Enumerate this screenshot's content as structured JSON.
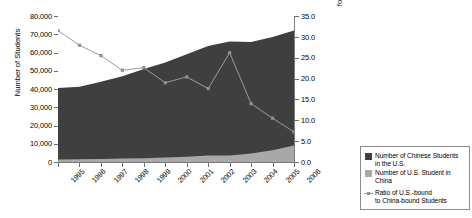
{
  "chart_data": {
    "type": "area",
    "title": "",
    "xlabel": "",
    "ylabel": "Number of Students",
    "ylabel_right": "Number of Chinese Students in America for Each American Student in China",
    "categories": [
      "1995",
      "1996",
      "1997",
      "1998",
      "1999",
      "2000",
      "2001",
      "2002",
      "2003",
      "2004",
      "2005",
      "2006"
    ],
    "ylim": [
      0,
      80000
    ],
    "yticks": [
      "0",
      "10,000",
      "20,000",
      "30,000",
      "40,000",
      "50,000",
      "60,000",
      "70,000",
      "80,000"
    ],
    "ytick_values": [
      0,
      10000,
      20000,
      30000,
      40000,
      50000,
      60000,
      70000,
      80000
    ],
    "ylim_right": [
      0,
      35
    ],
    "yticks_right": [
      "0.0",
      "5.0",
      "10.0",
      "15.0",
      "20.0",
      "25.0",
      "30.0",
      "35.0"
    ],
    "ytick_values_right": [
      0,
      5,
      10,
      15,
      20,
      25,
      30,
      35
    ],
    "grid": true,
    "legend_position": "outside-right-bottom",
    "series": [
      {
        "name": "Number of Chinese Students in the U.S.",
        "type": "area",
        "axis": "left",
        "color": "#3f3f3f",
        "values": [
          40500,
          41200,
          44000,
          47000,
          51000,
          54500,
          59000,
          63500,
          66000,
          65800,
          68500,
          72000
        ]
      },
      {
        "name": "Number of U.S. Student in China",
        "type": "area",
        "axis": "left",
        "color": "#a8a8a8",
        "values": [
          1400,
          1500,
          1700,
          1900,
          2100,
          2500,
          2900,
          3600,
          3500,
          4700,
          6400,
          9000
        ]
      },
      {
        "name": "Ratio of U.S.-bound to China-bound Students",
        "type": "line",
        "axis": "right",
        "color": "#9a9a9a",
        "marker": "square",
        "values": [
          31.5,
          28.0,
          25.5,
          22.0,
          22.6,
          19.0,
          20.4,
          17.6,
          26.2,
          14.0,
          10.5,
          7.2
        ]
      }
    ]
  },
  "legend": {
    "items": [
      {
        "label_line1": "Number of Chinese Students",
        "label_line2": "in the U.S.",
        "swatch": "dark-square-swatch"
      },
      {
        "label_line1": "Number of U.S. Student in China",
        "label_line2": "",
        "swatch": "light-square-swatch"
      },
      {
        "label_line1": "Ratio of U.S.-bound",
        "label_line2": "to China-bound Students",
        "swatch": "line-marker-swatch"
      }
    ]
  },
  "axes": {
    "left_title": "Number of Students",
    "right_title_line1": "Number of Chinese Students in America",
    "right_title_line2": "for Each American Student in China"
  }
}
